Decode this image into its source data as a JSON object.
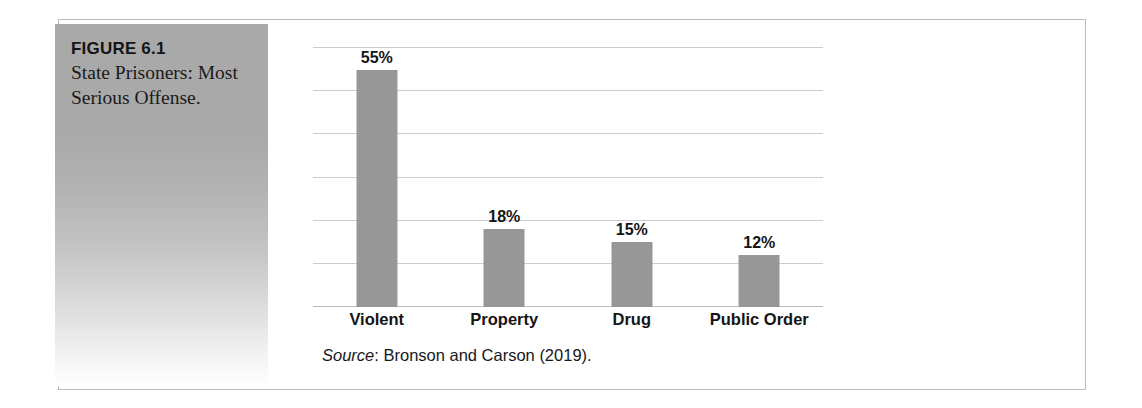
{
  "figure": {
    "number": "FIGURE 6.1",
    "title": "State Prisoners: Most Serious Offense.",
    "source_word": "Source",
    "source_rest": ": Bronson and Carson (2019)."
  },
  "colors": {
    "bar": "#979797",
    "gridline": "#c9ccd0",
    "panel_top": "#a9a9a9",
    "frame_border": "#b9bcc0",
    "text": "#151515"
  },
  "chart_data": {
    "type": "bar",
    "title": "State Prisoners: Most Serious Offense.",
    "xlabel": "",
    "ylabel": "",
    "ylim": [
      0,
      60
    ],
    "grid": true,
    "gridline_values": [
      60,
      50,
      40,
      30,
      20,
      10,
      0
    ],
    "legend": "none",
    "categories": [
      "Violent",
      "Property",
      "Drug",
      "Public Order"
    ],
    "values": [
      55,
      18,
      15,
      12
    ],
    "data_labels": [
      "55%",
      "18%",
      "15%",
      "12%"
    ],
    "annotations": [
      "Source: Bronson and Carson (2019)."
    ]
  }
}
